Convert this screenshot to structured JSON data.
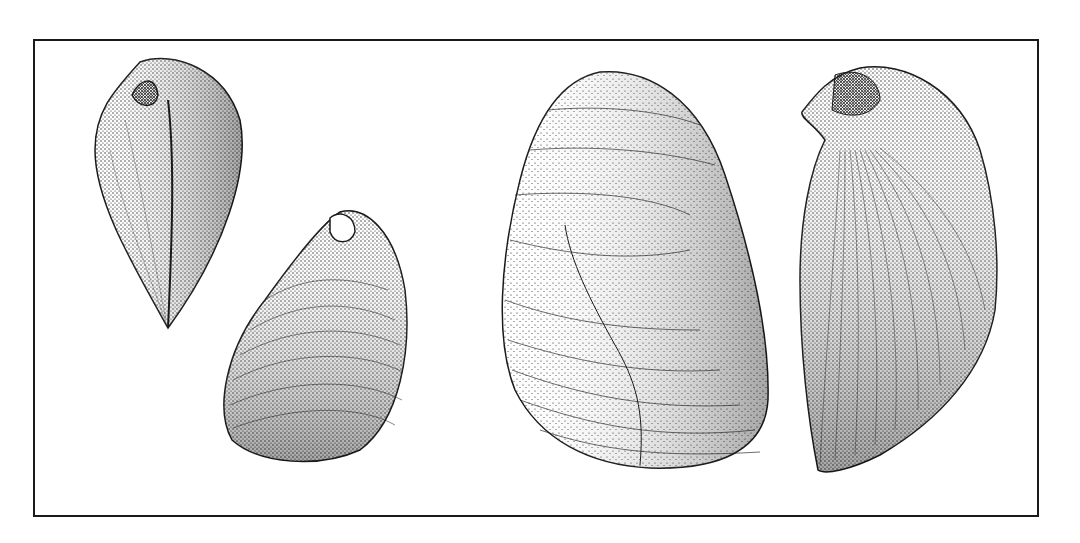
{
  "figure": {
    "kind": "scientific illustration",
    "style": "stipple engraving, black ink on white",
    "colors": {
      "ink": "#1a1a1a",
      "paper": "#ffffff"
    },
    "specimens": [
      {
        "id": "shell-1",
        "view": "dorsal view, umbo at top"
      },
      {
        "id": "shell-2",
        "view": "lateral view, concentric growth lines"
      },
      {
        "id": "shell-3",
        "view": "large lateral view with growth lines and crack"
      },
      {
        "id": "shell-4",
        "view": "lateral view with radial ribs"
      }
    ]
  }
}
